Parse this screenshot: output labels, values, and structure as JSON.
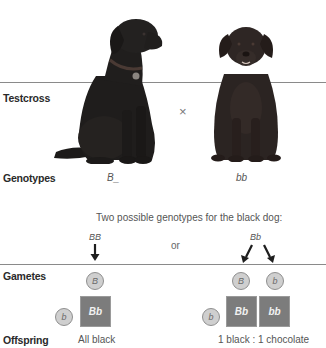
{
  "figure": {
    "rows": {
      "testcross": "Testcross",
      "genotypes": "Genotypes",
      "gametes": "Gametes",
      "offspring": "Offspring"
    },
    "parents": {
      "black_dog": {
        "description": "black Labrador retriever",
        "genotype": "B_"
      },
      "chocolate_dog": {
        "description": "chocolate Labrador retriever",
        "genotype": "bb"
      },
      "cross_symbol": "×"
    },
    "possible_genotypes_caption": "Two possible genotypes for the black dog:",
    "or_label": "or",
    "case_homozygous": {
      "genotype": "BB",
      "gametes_top": [
        "B"
      ],
      "gametes_side": [
        "b"
      ],
      "offspring_cells": [
        "Bb"
      ],
      "result": "All black"
    },
    "case_heterozygous": {
      "genotype": "Bb",
      "gametes_top": [
        "B",
        "b"
      ],
      "gametes_side": [
        "b"
      ],
      "offspring_cells": [
        "Bb",
        "bb"
      ],
      "result": "1 black : 1 chocolate"
    },
    "colors": {
      "square": "#7c7c7c",
      "circle": "#cfcfcf",
      "rule": "#8a8a8a"
    }
  }
}
